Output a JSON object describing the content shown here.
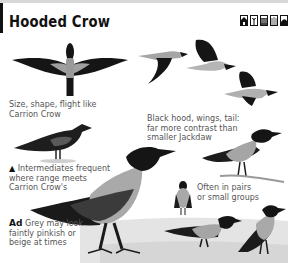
{
  "header": {
    "title": "Hooded Crow",
    "habitat_icons": [
      "house-icon",
      "tree-icon",
      "wetland-icon",
      "reedbed-icon",
      "hill-icon"
    ]
  },
  "captions": {
    "flight_line1": "Size, shape, flight like",
    "flight_line2": "Carrion Crow",
    "hood_line1": "Black hood, wings, tail:",
    "hood_line2": "far more contrast than",
    "hood_line3": "smaller Jackdaw",
    "intermediates_marker": "▲",
    "intermediates_line1": "Intermediates frequent",
    "intermediates_line2": "where range meets",
    "intermediates_line3": "Carrion Crow's",
    "groups_line1": "Often in pairs",
    "groups_line2": "or small groups",
    "adult_label": "Ad",
    "adult_line1": " Grey may look",
    "adult_line2": "faintly pinkish or",
    "adult_line3": "beige at times"
  },
  "colors": {
    "black": "#151515",
    "grey_body": "#a9a9a9",
    "ground": "#d9d9d9",
    "text": "#555555"
  }
}
